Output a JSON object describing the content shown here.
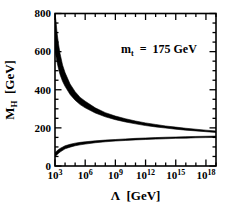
{
  "chart_data": {
    "type": "area",
    "title": "",
    "subtitle": "",
    "xlabel": "Λ  [GeV]",
    "ylabel": "M_H  [GeV]",
    "xscale": "log",
    "yscale": "linear",
    "xlim": [
      1000,
      1e+19
    ],
    "ylim": [
      0,
      800
    ],
    "grid": false,
    "legend": null,
    "annotations": [
      {
        "name": "top-mass-annotation",
        "text": "m_t  =  175 GeV",
        "text_parts": {
          "symbol": "m",
          "subscript": "t",
          "equals": "=",
          "value": "175 GeV"
        },
        "x": 10000000000.0,
        "y": 620
      }
    ],
    "x_tick_labels": [
      {
        "base": "10",
        "exp": "3",
        "value": 1000.0
      },
      {
        "base": "10",
        "exp": "6",
        "value": 1000000.0
      },
      {
        "base": "10",
        "exp": "9",
        "value": 1000000000.0
      },
      {
        "base": "10",
        "exp": "12",
        "value": 1000000000000.0
      },
      {
        "base": "10",
        "exp": "15",
        "value": 1000000000000000.0
      },
      {
        "base": "10",
        "exp": "18",
        "value": 1e+18
      }
    ],
    "y_tick_labels": [
      {
        "label": "0",
        "value": 0
      },
      {
        "label": "200",
        "value": 200
      },
      {
        "label": "400",
        "value": 400
      },
      {
        "label": "600",
        "value": 600
      },
      {
        "label": "800",
        "value": 800
      }
    ],
    "y_minor_step": 50,
    "series": [
      {
        "name": "triviality-upper-bound",
        "role": "upper bound band",
        "color": "#000000",
        "log10_x": [
          3.0,
          3.1,
          3.2,
          3.35,
          3.5,
          3.75,
          4.0,
          4.5,
          5.0,
          5.5,
          6.0,
          7.0,
          8.0,
          9.0,
          10.0,
          11.0,
          12.0,
          13.0,
          14.0,
          15.0,
          16.0,
          17.0,
          18.0,
          19.0
        ],
        "upper": [
          800,
          760,
          700,
          640,
          590,
          530,
          490,
          430,
          390,
          360,
          340,
          305,
          280,
          262,
          248,
          236,
          226,
          218,
          210,
          204,
          198,
          193,
          188,
          184
        ],
        "lower": [
          600,
          575,
          545,
          510,
          480,
          444,
          418,
          375,
          345,
          322,
          305,
          278,
          258,
          243,
          231,
          221,
          212,
          205,
          199,
          193,
          188,
          184,
          180,
          176
        ]
      },
      {
        "name": "vacuum-stability-lower-bound",
        "role": "lower bound band",
        "color": "#000000",
        "log10_x": [
          3.0,
          3.25,
          3.5,
          4.0,
          4.5,
          5.0,
          5.5,
          6.0,
          7.0,
          8.0,
          9.0,
          10.0,
          11.0,
          12.0,
          13.0,
          14.0,
          15.0,
          16.0,
          17.0,
          18.0,
          19.0
        ],
        "upper": [
          70,
          82,
          92,
          106,
          114,
          120,
          124,
          127,
          132,
          136,
          139,
          142,
          145,
          147,
          149,
          151,
          152,
          154,
          155,
          156,
          157
        ],
        "lower": [
          48,
          62,
          73,
          90,
          99,
          106,
          111,
          115,
          122,
          127,
          131,
          134,
          137,
          139,
          141,
          143,
          145,
          146,
          148,
          149,
          150
        ]
      }
    ]
  },
  "figure": {
    "background_color": "#ffffff",
    "axis_color": "#000000",
    "band_color": "#000000"
  }
}
